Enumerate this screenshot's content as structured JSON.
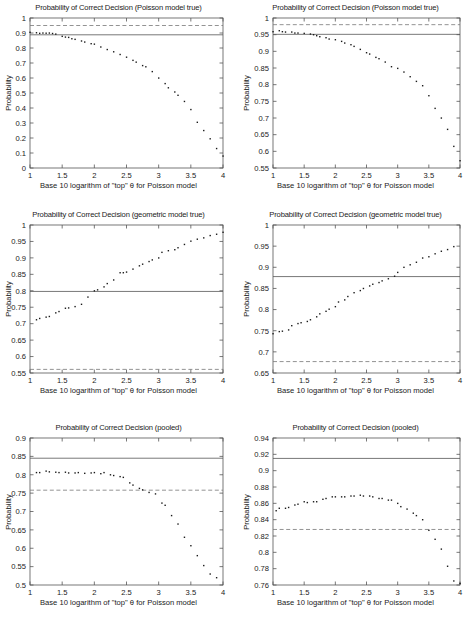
{
  "figure": {
    "axis_color": "#555555",
    "point_color": "#1a1a1a",
    "solid_line_color": "#555555",
    "dashed_line_color": "#777777",
    "xlabel": "Base 10 logarithm of \"top\" θ for Poisson model",
    "ylabel": "Probability"
  },
  "chart_data": [
    {
      "id": "top-left",
      "type": "scatter",
      "title": "Probability of Correct Decision (Poisson model true)",
      "xlabel": "Base 10 logarithm of \"top\" θ for Poisson model",
      "ylabel": "Probability",
      "xlim": [
        1,
        4
      ],
      "ylim": [
        0,
        1
      ],
      "xticks": [
        1,
        1.5,
        2,
        2.5,
        3,
        3.5,
        4
      ],
      "xticklabels": [
        "1",
        "1.5",
        "2",
        "2.5",
        "3",
        "3.5",
        "4"
      ],
      "yticks": [
        0,
        0.1,
        0.2,
        0.3,
        0.4,
        0.5,
        0.6,
        0.7,
        0.8,
        0.9,
        1
      ],
      "yticklabels": [
        "0",
        "0.1",
        "0.2",
        "0.3",
        "0.4",
        "0.5",
        "0.6",
        "0.7",
        "0.8",
        "0.9",
        "1"
      ],
      "grid": false,
      "legend": "none",
      "hlines": [
        {
          "y": 0.888,
          "style": "solid"
        },
        {
          "y": 0.95,
          "style": "dashed"
        }
      ],
      "x": [
        1.0,
        1.1,
        1.15,
        1.2,
        1.25,
        1.3,
        1.35,
        1.4,
        1.5,
        1.55,
        1.6,
        1.65,
        1.7,
        1.8,
        1.85,
        1.95,
        2.0,
        2.1,
        2.2,
        2.3,
        2.4,
        2.5,
        2.6,
        2.65,
        2.75,
        2.8,
        2.9,
        3.0,
        3.1,
        3.15,
        3.25,
        3.3,
        3.4,
        3.5,
        3.6,
        3.7,
        3.8,
        3.9,
        4.0
      ],
      "y": [
        0.905,
        0.902,
        0.898,
        0.9,
        0.899,
        0.9,
        0.897,
        0.893,
        0.878,
        0.873,
        0.871,
        0.862,
        0.858,
        0.847,
        0.84,
        0.829,
        0.826,
        0.807,
        0.79,
        0.775,
        0.757,
        0.739,
        0.718,
        0.706,
        0.683,
        0.675,
        0.643,
        0.6,
        0.563,
        0.535,
        0.507,
        0.485,
        0.444,
        0.39,
        0.305,
        0.25,
        0.195,
        0.13,
        0.08
      ]
    },
    {
      "id": "top-right",
      "type": "scatter",
      "title": "Probability of Correct Decision (Poisson model true)",
      "xlabel": "Base 10 logarithm of \"top\" θ for Poisson model",
      "ylabel": "Probability",
      "xlim": [
        1,
        4
      ],
      "ylim": [
        0.55,
        1
      ],
      "xticks": [
        1,
        1.5,
        2,
        2.5,
        3,
        3.5,
        4
      ],
      "xticklabels": [
        "1",
        "1.5",
        "2",
        "2.5",
        "3",
        "3.5",
        "4"
      ],
      "yticks": [
        0.55,
        0.6,
        0.65,
        0.7,
        0.75,
        0.8,
        0.85,
        0.9,
        0.95,
        1
      ],
      "yticklabels": [
        "0.55",
        "0.6",
        "0.65",
        "0.7",
        "0.75",
        "0.8",
        "0.85",
        "0.9",
        "0.95",
        "1"
      ],
      "grid": false,
      "legend": "none",
      "hlines": [
        {
          "y": 0.951,
          "style": "solid"
        },
        {
          "y": 0.98,
          "style": "dashed"
        }
      ],
      "x": [
        1.0,
        1.1,
        1.15,
        1.2,
        1.3,
        1.35,
        1.4,
        1.5,
        1.6,
        1.65,
        1.7,
        1.75,
        1.85,
        1.9,
        2.0,
        2.1,
        2.15,
        2.25,
        2.3,
        2.4,
        2.5,
        2.55,
        2.65,
        2.7,
        2.8,
        2.9,
        3.0,
        3.1,
        3.2,
        3.3,
        3.4,
        3.5,
        3.6,
        3.7,
        3.8,
        3.9,
        4.0
      ],
      "y": [
        0.959,
        0.962,
        0.959,
        0.958,
        0.958,
        0.955,
        0.955,
        0.954,
        0.952,
        0.95,
        0.947,
        0.944,
        0.941,
        0.937,
        0.935,
        0.93,
        0.925,
        0.92,
        0.915,
        0.906,
        0.896,
        0.892,
        0.882,
        0.878,
        0.868,
        0.854,
        0.849,
        0.838,
        0.824,
        0.81,
        0.797,
        0.767,
        0.729,
        0.7,
        0.666,
        0.615,
        0.572
      ]
    },
    {
      "id": "middle-left",
      "type": "scatter",
      "title": "Probability of Correct Decision (geometric model true)",
      "xlabel": "Base 10 logarithm of \"top\" θ for Poisson model",
      "ylabel": "Probability",
      "xlim": [
        1,
        4
      ],
      "ylim": [
        0.55,
        1
      ],
      "xticks": [
        1,
        1.5,
        2,
        2.5,
        3,
        3.5,
        4
      ],
      "xticklabels": [
        "1",
        "1.5",
        "2",
        "2.5",
        "3",
        "3.5",
        "4"
      ],
      "yticks": [
        0.55,
        0.6,
        0.65,
        0.7,
        0.75,
        0.8,
        0.85,
        0.9,
        0.95,
        1
      ],
      "yticklabels": [
        "0.55",
        "0.6",
        "0.65",
        "0.7",
        "0.75",
        "0.8",
        "0.85",
        "0.9",
        "0.95",
        "1"
      ],
      "grid": false,
      "legend": "none",
      "hlines": [
        {
          "y": 0.798,
          "style": "solid"
        },
        {
          "y": 0.561,
          "style": "dashed"
        }
      ],
      "x": [
        1.1,
        1.15,
        1.25,
        1.3,
        1.4,
        1.45,
        1.55,
        1.6,
        1.7,
        1.8,
        1.9,
        2.0,
        2.05,
        2.15,
        2.2,
        2.3,
        2.4,
        2.45,
        2.5,
        2.6,
        2.7,
        2.75,
        2.85,
        2.9,
        3.0,
        3.05,
        3.15,
        3.25,
        3.3,
        3.4,
        3.5,
        3.6,
        3.7,
        3.8,
        3.9,
        4.0
      ],
      "y": [
        0.712,
        0.716,
        0.72,
        0.722,
        0.733,
        0.737,
        0.747,
        0.748,
        0.752,
        0.759,
        0.781,
        0.8,
        0.803,
        0.812,
        0.822,
        0.833,
        0.855,
        0.855,
        0.857,
        0.866,
        0.876,
        0.881,
        0.889,
        0.894,
        0.9,
        0.917,
        0.922,
        0.925,
        0.931,
        0.941,
        0.951,
        0.957,
        0.961,
        0.968,
        0.972,
        0.978
      ]
    },
    {
      "id": "middle-right",
      "type": "scatter",
      "title": "Probability of Correct Decision (geometric model true)",
      "xlabel": "Base 10 logarithm of \"top\" θ for Poisson model",
      "ylabel": "Probability",
      "xlim": [
        1,
        4
      ],
      "ylim": [
        0.65,
        1
      ],
      "xticks": [
        1,
        1.5,
        2,
        2.5,
        3,
        3.5,
        4
      ],
      "xticklabels": [
        "1",
        "1.5",
        "2",
        "2.5",
        "3",
        "3.5",
        "4"
      ],
      "yticks": [
        0.65,
        0.7,
        0.75,
        0.8,
        0.85,
        0.9,
        0.95,
        1
      ],
      "yticklabels": [
        "0.65",
        "0.7",
        "0.75",
        "0.8",
        "0.85",
        "0.9",
        "0.95",
        "1"
      ],
      "grid": false,
      "legend": "none",
      "hlines": [
        {
          "y": 0.878,
          "style": "solid"
        },
        {
          "y": 0.677,
          "style": "dashed"
        }
      ],
      "x": [
        1.0,
        1.1,
        1.15,
        1.25,
        1.3,
        1.4,
        1.45,
        1.55,
        1.6,
        1.7,
        1.75,
        1.85,
        1.9,
        2.0,
        2.05,
        2.15,
        2.2,
        2.3,
        2.4,
        2.45,
        2.55,
        2.6,
        2.7,
        2.75,
        2.85,
        2.95,
        3.0,
        3.1,
        3.2,
        3.3,
        3.4,
        3.5,
        3.6,
        3.7,
        3.8,
        3.9
      ],
      "y": [
        0.743,
        0.748,
        0.749,
        0.752,
        0.762,
        0.767,
        0.769,
        0.772,
        0.776,
        0.783,
        0.79,
        0.796,
        0.801,
        0.807,
        0.818,
        0.823,
        0.831,
        0.84,
        0.845,
        0.85,
        0.856,
        0.86,
        0.864,
        0.868,
        0.873,
        0.879,
        0.888,
        0.9,
        0.906,
        0.912,
        0.922,
        0.925,
        0.932,
        0.938,
        0.942,
        0.949
      ]
    },
    {
      "id": "bottom-left",
      "type": "scatter",
      "title": "Probability of Correct Decision (pooled)",
      "xlabel": "Base 10 logarithm of \"top\" θ for Poisson model",
      "ylabel": "Probability",
      "xlim": [
        1,
        4
      ],
      "ylim": [
        0.5,
        0.9
      ],
      "xticks": [
        1,
        1.5,
        2,
        2.5,
        3,
        3.5,
        4
      ],
      "xticklabels": [
        "1",
        "1.5",
        "2",
        "2.5",
        "3",
        "3.5",
        "4"
      ],
      "yticks": [
        0.5,
        0.55,
        0.6,
        0.65,
        0.7,
        0.75,
        0.8,
        0.85,
        0.9
      ],
      "yticklabels": [
        "0.5",
        "0.55",
        "0.6",
        "0.65",
        "0.7",
        "0.75",
        "0.8",
        "0.85",
        "0.9"
      ],
      "grid": false,
      "legend": "none",
      "hlines": [
        {
          "y": 0.845,
          "style": "solid"
        },
        {
          "y": 0.758,
          "style": "dashed"
        }
      ],
      "x": [
        1.1,
        1.15,
        1.25,
        1.3,
        1.4,
        1.45,
        1.55,
        1.6,
        1.7,
        1.75,
        1.85,
        1.95,
        2.0,
        2.1,
        2.15,
        2.25,
        2.3,
        2.4,
        2.45,
        2.55,
        2.6,
        2.7,
        2.75,
        2.85,
        2.95,
        3.05,
        3.1,
        3.2,
        3.3,
        3.4,
        3.5,
        3.6,
        3.7,
        3.8,
        3.9
      ],
      "y": [
        0.806,
        0.806,
        0.81,
        0.808,
        0.807,
        0.806,
        0.807,
        0.805,
        0.805,
        0.806,
        0.804,
        0.805,
        0.806,
        0.803,
        0.806,
        0.8,
        0.798,
        0.795,
        0.793,
        0.778,
        0.772,
        0.763,
        0.759,
        0.752,
        0.748,
        0.723,
        0.717,
        0.689,
        0.666,
        0.63,
        0.607,
        0.58,
        0.553,
        0.53,
        0.52
      ]
    },
    {
      "id": "bottom-right",
      "type": "scatter",
      "title": "Probability of Correct Decision (pooled)",
      "xlabel": "Base 10 logarithm of \"top\" θ for Poisson model",
      "ylabel": "Probability",
      "xlim": [
        1,
        4
      ],
      "ylim": [
        0.76,
        0.94
      ],
      "xticks": [
        1,
        1.5,
        2,
        2.5,
        3,
        3.5,
        4
      ],
      "xticklabels": [
        "1",
        "1.5",
        "2",
        "2.5",
        "3",
        "3.5",
        "4"
      ],
      "yticks": [
        0.76,
        0.78,
        0.8,
        0.82,
        0.84,
        0.86,
        0.88,
        0.9,
        0.92,
        0.94
      ],
      "yticklabels": [
        "0.76",
        "0.78",
        "0.8",
        "0.82",
        "0.84",
        "0.86",
        "0.88",
        "0.9",
        "0.92",
        "0.94"
      ],
      "grid": false,
      "legend": "none",
      "hlines": [
        {
          "y": 0.915,
          "style": "solid"
        },
        {
          "y": 0.828,
          "style": "dashed"
        }
      ],
      "x": [
        1.05,
        1.1,
        1.2,
        1.25,
        1.35,
        1.4,
        1.5,
        1.55,
        1.65,
        1.7,
        1.8,
        1.85,
        1.95,
        2.0,
        2.1,
        2.15,
        2.25,
        2.3,
        2.4,
        2.45,
        2.55,
        2.6,
        2.7,
        2.75,
        2.85,
        2.9,
        3.0,
        3.05,
        3.15,
        3.25,
        3.3,
        3.4,
        3.5,
        3.6,
        3.7,
        3.8,
        3.9,
        4.0
      ],
      "y": [
        0.851,
        0.854,
        0.854,
        0.855,
        0.858,
        0.859,
        0.862,
        0.861,
        0.862,
        0.862,
        0.865,
        0.866,
        0.868,
        0.868,
        0.868,
        0.868,
        0.869,
        0.869,
        0.87,
        0.869,
        0.869,
        0.868,
        0.866,
        0.866,
        0.864,
        0.864,
        0.86,
        0.856,
        0.853,
        0.848,
        0.845,
        0.84,
        0.827,
        0.816,
        0.804,
        0.783,
        0.765,
        0.762
      ]
    }
  ]
}
